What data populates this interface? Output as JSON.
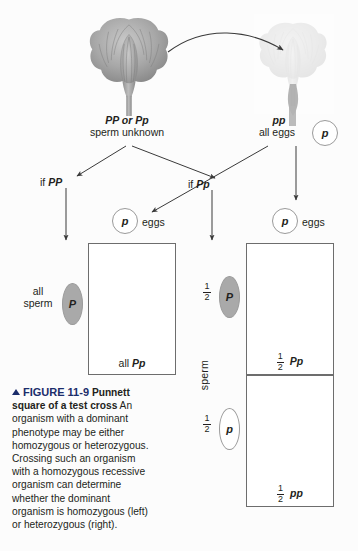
{
  "figure": {
    "number": "FIGURE 11-9",
    "title": "Punnett square of a test cross",
    "body": "An organism with a dominant phenotype may be either homozygous or heterozygous. Crossing such an organism with a homozygous recessive organism can determine whether the dominant organism is homozygous (left) or heterozygous (right).",
    "accent_color": "#1b2d6b"
  },
  "cross": {
    "pollen_label": "pollen",
    "parent_left": {
      "genotype": "PP or Pp",
      "gamete_note": "sperm unknown"
    },
    "parent_right": {
      "genotype": "pp",
      "gamete_note": "all eggs",
      "egg_allele": "p"
    },
    "branch_left_label": "if PP",
    "branch_right_label": "if Pp"
  },
  "case_homozygous": {
    "egg_allele": "p",
    "egg_label": "eggs",
    "sperm_fraction": "all",
    "sperm_word": "sperm",
    "sperm_allele": "P",
    "offspring": [
      {
        "fraction": "all",
        "genotype": "Pp",
        "flower": "purple"
      }
    ]
  },
  "case_heterozygous": {
    "egg_allele": "p",
    "egg_label": "eggs",
    "sperm_word": "sperm",
    "sperm_rows": [
      {
        "num": "1",
        "den": "2",
        "allele": "P",
        "filled": true
      },
      {
        "num": "1",
        "den": "2",
        "allele": "p",
        "filled": false
      }
    ],
    "offspring": [
      {
        "num": "1",
        "den": "2",
        "genotype": "Pp",
        "flower": "purple"
      },
      {
        "num": "1",
        "den": "2",
        "genotype": "pp",
        "flower": "white"
      }
    ]
  },
  "colors": {
    "ink": "#231f20",
    "box_stroke": "#6d6d6d",
    "gamete_stroke": "#9a9a9a",
    "sperm_fill": "#a9a9a9",
    "flower_dark": "#9b9b9b",
    "flower_light": "#ececec"
  }
}
